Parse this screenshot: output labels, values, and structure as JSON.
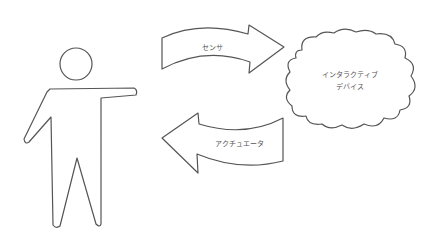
{
  "diagram": {
    "nodes": {
      "person": {
        "label": "",
        "shape": "human-figure"
      },
      "device": {
        "line1": "インタラクティブ",
        "line2": "デバイス",
        "shape": "cloud"
      }
    },
    "edges": {
      "sensor": {
        "label": "センサ",
        "direction": "person-to-device"
      },
      "actuator": {
        "label": "アクチュエータ",
        "direction": "device-to-person"
      }
    },
    "colors": {
      "stroke": "#555555",
      "fill": "#ffffff",
      "text": "#555555"
    }
  }
}
